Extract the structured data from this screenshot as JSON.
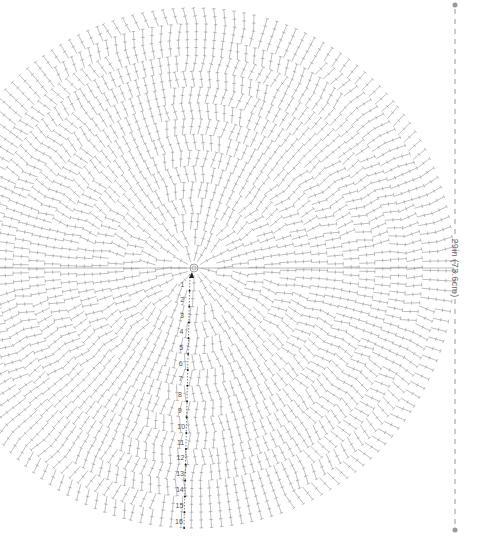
{
  "diagram": {
    "type": "crochet-round-chart",
    "center": {
      "x": 194,
      "y": 268
    },
    "radius": 260,
    "rounds": 16,
    "row_numbers": [
      "1",
      "2",
      "3",
      "4",
      "5",
      "6",
      "7",
      "8",
      "9",
      "10",
      "11",
      "12",
      "13",
      "14",
      "15",
      "16"
    ],
    "stitch_color": "#8a8a8a",
    "dimension": {
      "label": "29in (73.6cm)",
      "line_x": 455,
      "top_y": 5,
      "bottom_y": 530,
      "color": "#999999"
    }
  }
}
